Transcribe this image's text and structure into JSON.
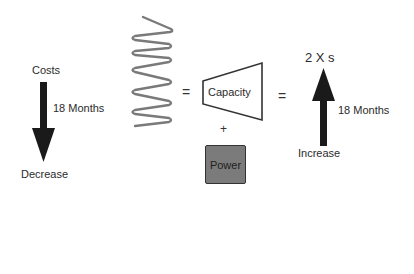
{
  "diagram": {
    "left": {
      "top_label": "Costs",
      "period_label": "18 Months",
      "bottom_label": "Decrease",
      "arrow_direction": "down"
    },
    "spring": {
      "shape": "coil-spring",
      "color": "#7a7a7a"
    },
    "middle": {
      "equals_1": "=",
      "capacity_label": "Capacity",
      "plus": "+",
      "power_label": "Power",
      "power_color": "#7b7b7b",
      "equals_2": "="
    },
    "right": {
      "top_label": "2 X s",
      "period_label": "18 Months",
      "bottom_label": "Increase",
      "arrow_direction": "up"
    },
    "colors": {
      "arrow": "#1a1a1a",
      "text": "#2b2b2b",
      "background": "#ffffff"
    }
  }
}
